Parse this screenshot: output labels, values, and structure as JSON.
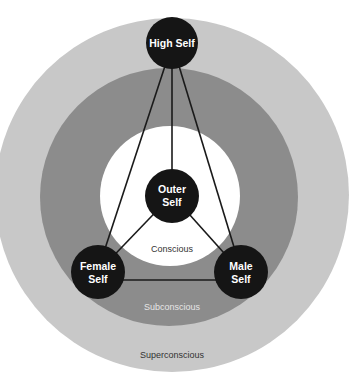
{
  "colors": {
    "background": "#ffffff",
    "superconscious_ring": "#c8c8c8",
    "subconscious_ring": "#8c8c8c",
    "conscious_area": "#ffffff",
    "node_fill": "#151515",
    "node_text": "#ffffff",
    "line": "#1a1a1a"
  },
  "zones": {
    "superconscious": "Superconscious",
    "subconscious": "Subconscious",
    "conscious": "Conscious"
  },
  "nodes": {
    "high_self": {
      "line1": "High Self"
    },
    "outer_self": {
      "line1": "Outer",
      "line2": "Self"
    },
    "female_self": {
      "line1": "Female",
      "line2": "Self"
    },
    "male_self": {
      "line1": "Male",
      "line2": "Self"
    }
  }
}
